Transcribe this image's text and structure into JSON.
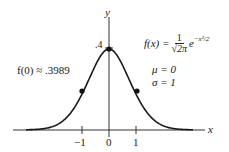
{
  "chart_data": {
    "type": "line",
    "title": "",
    "xlabel": "x",
    "ylabel": "y",
    "x_ticks": [
      "-1",
      "0",
      "1"
    ],
    "y_ticks": [
      ".4"
    ],
    "series": [
      {
        "name": "standard normal density",
        "x": [
          -3,
          -2.5,
          -2,
          -1.5,
          -1,
          -0.5,
          0,
          0.5,
          1,
          1.5,
          2,
          2.5,
          3
        ],
        "values": [
          0.0044,
          0.0175,
          0.054,
          0.1295,
          0.242,
          0.3521,
          0.3989,
          0.3521,
          0.242,
          0.1295,
          0.054,
          0.0175,
          0.0044
        ]
      }
    ],
    "marked_points": [
      {
        "x": -1,
        "y": 0.242
      },
      {
        "x": 0,
        "y": 0.3989
      },
      {
        "x": 1,
        "y": 0.242
      }
    ],
    "annotations": [
      "f(0) ≈ .3989",
      "f(x) = 1/√(2π) e^(−x²/2)",
      "μ = 0",
      "σ = 1"
    ],
    "xlim": [
      -3.5,
      3.6
    ],
    "ylim": [
      0,
      0.48
    ],
    "grid": false,
    "legend": "none"
  },
  "labels": {
    "x_axis": "x",
    "y_axis": "y",
    "y_tick": ".4",
    "x_tick_neg1": "−1",
    "x_tick_0": "0",
    "x_tick_1": "1",
    "f0": "f(0) ≈ .3989",
    "formula_lhs": "f(x) =",
    "formula_num": "1",
    "formula_den": "√2π",
    "formula_exp_base": "e",
    "formula_exp": "−x²/2",
    "mu": "μ = 0",
    "sigma": "σ = 1"
  }
}
